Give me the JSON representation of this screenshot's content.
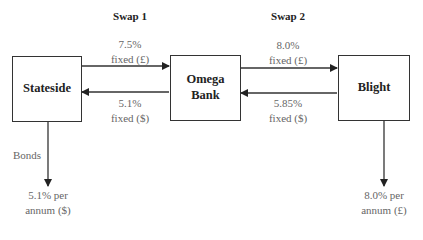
{
  "titles": {
    "swap1": "Swap 1",
    "swap2": "Swap 2"
  },
  "entities": {
    "stateside": "Stateside",
    "omega_line1": "Omega",
    "omega_line2": "Bank",
    "blight": "Blight"
  },
  "flows": {
    "s1_top_line1": "7.5%",
    "s1_top_line2": "fixed (£)",
    "s1_bottom_line1": "5.1%",
    "s1_bottom_line2": "fixed ($)",
    "s2_top_line1": "8.0%",
    "s2_top_line2": "fixed (£)",
    "s2_bottom_line1": "5.85%",
    "s2_bottom_line2": "fixed ($)",
    "bonds_label": "Bonds",
    "stateside_out_line1": "5.1% per",
    "stateside_out_line2": "annum ($)",
    "blight_out_line1": "8.0% per",
    "blight_out_line2": "annum (£)"
  },
  "colors": {
    "line": "#333333",
    "label_text": "#666666"
  }
}
